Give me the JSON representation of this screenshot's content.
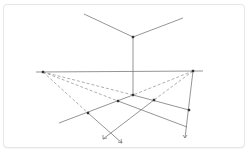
{
  "diagram": {
    "title": "",
    "type": "three-point perspective construction",
    "colors": {
      "line": "#7a7a7a",
      "dashed": "#9a9a9a",
      "point": "#333333",
      "border": "#e6e6e6"
    },
    "points": {
      "top_vertex": [
        133,
        37
      ],
      "top_left_end": [
        84,
        14
      ],
      "top_right_end": [
        183,
        18
      ],
      "horizon_left": [
        36,
        72
      ],
      "horizon_right": [
        203,
        71
      ],
      "vp_left": [
        43,
        72
      ],
      "vp_right": [
        193,
        71
      ],
      "center": [
        133,
        95
      ],
      "a": [
        118,
        101
      ],
      "b": [
        154,
        100
      ],
      "d": [
        88,
        113
      ],
      "e": [
        189,
        110
      ],
      "f": [
        187,
        127
      ],
      "left_end": [
        59,
        123
      ],
      "arrow_left": [
        103,
        139
      ],
      "arrow_mid": [
        122,
        143
      ],
      "arrow_right": [
        185,
        138
      ]
    }
  }
}
